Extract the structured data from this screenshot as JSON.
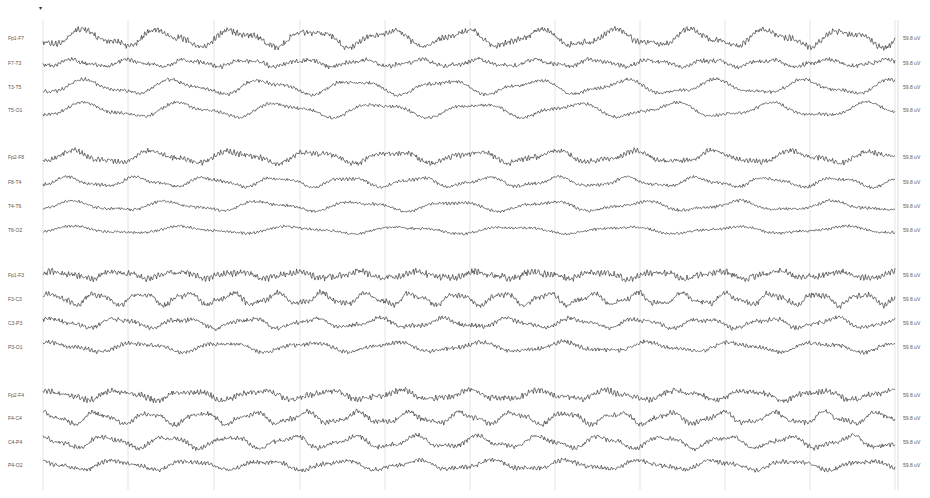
{
  "viewer": {
    "marker_glyph": "▾",
    "trace_color": "#3a3a3a",
    "grid_color": "#e4e4e4",
    "grid_x": [
      43,
      128,
      214,
      300,
      385,
      470,
      555,
      640,
      725,
      810,
      895
    ],
    "trace_x_start": 43,
    "trace_x_end": 895
  },
  "channels": [
    {
      "label": "Fp1-F7",
      "scale": "59.8 uV",
      "y": 38,
      "amp": 7,
      "period": 76,
      "noise": 2.2,
      "group": 1
    },
    {
      "label": "F7-T3",
      "scale": "59.8 uV",
      "y": 63,
      "amp": 3,
      "period": 58,
      "noise": 1.6,
      "group": 1
    },
    {
      "label": "T3-T5",
      "scale": "59.8 uV",
      "y": 87,
      "amp": 6,
      "period": 90,
      "noise": 1.3,
      "group": 1
    },
    {
      "label": "T5-O1",
      "scale": "59.8 uV",
      "y": 110,
      "amp": 6,
      "period": 98,
      "noise": 1.2,
      "group": 1
    },
    {
      "label": "Fp2-F8",
      "scale": "59.8 uV",
      "y": 157,
      "amp": 5,
      "period": 80,
      "noise": 2.0,
      "group": 2
    },
    {
      "label": "F8-T4",
      "scale": "59.8 uV",
      "y": 182,
      "amp": 4,
      "period": 70,
      "noise": 1.2,
      "group": 2
    },
    {
      "label": "T4-T6",
      "scale": "59.8 uV",
      "y": 206,
      "amp": 4,
      "period": 95,
      "noise": 1.1,
      "group": 2
    },
    {
      "label": "T6-O2",
      "scale": "59.8 uV",
      "y": 230,
      "amp": 3,
      "period": 110,
      "noise": 1.0,
      "group": 2
    },
    {
      "label": "Fp1-F3",
      "scale": "59.8 uV",
      "y": 275,
      "amp": 3,
      "period": 60,
      "noise": 2.4,
      "group": 3
    },
    {
      "label": "F3-C3",
      "scale": "59.8 uV",
      "y": 299,
      "amp": 5,
      "period": 45,
      "noise": 2.0,
      "group": 3
    },
    {
      "label": "C3-P3",
      "scale": "59.8 uV",
      "y": 323,
      "amp": 4,
      "period": 65,
      "noise": 1.6,
      "group": 3
    },
    {
      "label": "P3-O1",
      "scale": "59.8 uV",
      "y": 347,
      "amp": 4,
      "period": 85,
      "noise": 1.5,
      "group": 3
    },
    {
      "label": "Fp2-F4",
      "scale": "59.8 uV",
      "y": 395,
      "amp": 4,
      "period": 70,
      "noise": 2.2,
      "group": 4
    },
    {
      "label": "F4-C4",
      "scale": "59.8 uV",
      "y": 418,
      "amp": 5,
      "period": 52,
      "noise": 1.8,
      "group": 4
    },
    {
      "label": "C4-P4",
      "scale": "59.8 uV",
      "y": 442,
      "amp": 5,
      "period": 62,
      "noise": 1.7,
      "group": 4
    },
    {
      "label": "P4-O2",
      "scale": "59.8 uV",
      "y": 465,
      "amp": 4,
      "period": 75,
      "noise": 1.6,
      "group": 4
    }
  ]
}
